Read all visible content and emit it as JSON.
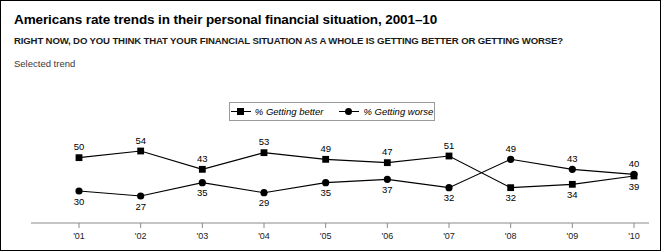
{
  "figure": {
    "title": "Americans rate trends in their personal financial situation, 2001–10",
    "subtitle": "RIGHT NOW, DO YOU THINK THAT YOUR FINANCIAL SITUATION AS A WHOLE IS GETTING BETTER OR GETTING WORSE?",
    "note": "Selected trend",
    "border_color": "#000000",
    "background_color": "#ffffff"
  },
  "legend": {
    "position": "top-center",
    "entries": [
      {
        "label": "% Getting better",
        "marker": "square",
        "color": "#000000"
      },
      {
        "label": "% Getting worse",
        "marker": "circle",
        "color": "#000000"
      }
    ]
  },
  "chart_data": {
    "type": "line",
    "title": "Americans rate trends in their personal financial situation, 2001–10",
    "subtitle": "RIGHT NOW, DO YOU THINK THAT YOUR FINANCIAL SITUATION AS A WHOLE IS GETTING BETTER OR GETTING WORSE?",
    "xlabel": "",
    "ylabel": "",
    "categories": [
      "'01",
      "'02",
      "'03",
      "'04",
      "'05",
      "'06",
      "'07",
      "'08",
      "'09",
      "'10"
    ],
    "ylim": [
      20,
      60
    ],
    "grid": false,
    "legend_position": "top-center",
    "series": [
      {
        "name": "% Getting better",
        "marker": "square",
        "color": "#000000",
        "values": [
          50,
          54,
          43,
          53,
          49,
          47,
          51,
          32,
          34,
          39
        ],
        "label_side": [
          "above",
          "above",
          "above",
          "above",
          "above",
          "above",
          "above",
          "below",
          "below",
          "below"
        ]
      },
      {
        "name": "% Getting worse",
        "marker": "circle",
        "color": "#000000",
        "values": [
          30,
          27,
          35,
          29,
          35,
          37,
          32,
          49,
          43,
          40
        ],
        "label_side": [
          "below",
          "below",
          "below",
          "below",
          "below",
          "below",
          "below",
          "above",
          "above",
          "above"
        ]
      }
    ]
  },
  "axis": {
    "line_color": "#8a8a8a",
    "tick_color": "#8a8a8a",
    "tick_labels": [
      "'01",
      "'02",
      "'03",
      "'04",
      "'05",
      "'06",
      "'07",
      "'08",
      "'09",
      "'10"
    ]
  }
}
